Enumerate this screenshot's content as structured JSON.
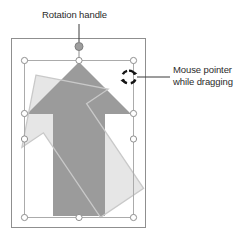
{
  "figure": {
    "callouts": [
      {
        "id": "rotation-handle",
        "label": "Rotation handle",
        "target": "rotation-handle-dot"
      },
      {
        "id": "mouse-pointer",
        "label_line1": "Mouse pointer",
        "label_line2": "while dragging",
        "target": "rotation-cursor"
      }
    ],
    "canvas": {
      "name": "slide-canvas",
      "border_color": "#8c8c8c",
      "fill_color": "#ffffff",
      "x": 11,
      "y": 38,
      "width": 135,
      "height": 190
    },
    "selection": {
      "name": "selection-box",
      "border_color": "#a8a8a8",
      "handle_fill": "#ffffff",
      "handle_stroke": "#8f8f8f",
      "x": 24,
      "y": 60,
      "width": 110,
      "height": 158,
      "handle_count": 8
    },
    "rotation_handle": {
      "name": "rotation-handle-dot",
      "fill_color": "#9a9a9a",
      "stroke_color": "#7a7a7a",
      "stem_color": "#8a8a8a",
      "cx": 79,
      "cy": 47,
      "r": 4
    },
    "shape": {
      "name": "up-arrow-shape",
      "fill_color": "#9b9b9b",
      "description": "Block arrow pointing up"
    },
    "ghost_shape": {
      "name": "rotated-preview-arrow",
      "fill_color": "#e4e4e4",
      "outline_color": "#d2d2d2",
      "rotation_degrees": -35,
      "description": "Light preview of the arrow rotated counterclockwise"
    },
    "cursor": {
      "name": "rotation-cursor",
      "icon": "rotate-circular-arrows-icon",
      "color": "#1f1f1f",
      "cx": 129,
      "cy": 77,
      "r": 6.5
    },
    "leader_lines": {
      "color": "#3a3a3a",
      "width": 1
    }
  }
}
